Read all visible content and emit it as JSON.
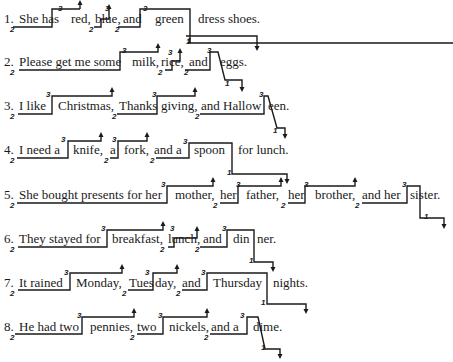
{
  "exercise": {
    "sentences": [
      {
        "number": "1.",
        "text": "She has red, blue, and green dress shoes.",
        "segments": [
          "She has",
          "red,",
          "blue,",
          "and",
          "green",
          "dress shoes."
        ]
      },
      {
        "number": "2.",
        "text": "Please get me some milk, rice, and eggs.",
        "segments": [
          "Please get me some",
          "milk,",
          "rice,",
          "and",
          "eggs."
        ]
      },
      {
        "number": "3.",
        "text": "I like Christmas, Thanksgiving, and Halloween.",
        "segments": [
          "I like",
          "Christmas,",
          "Thanks",
          "giving,",
          "and Hallow",
          "een."
        ]
      },
      {
        "number": "4.",
        "text": "I need a knife, a fork, and a spoon for lunch.",
        "segments": [
          "I need a",
          "knife,",
          "a",
          "fork,",
          "and a",
          "spoon",
          "for lunch."
        ]
      },
      {
        "number": "5.",
        "text": "She bought presents for her mother, her father, her brother, and her sister.",
        "segments": [
          "She bought presents for her",
          "mother,",
          "her",
          "father,",
          "her",
          "brother,",
          "and her",
          "sis",
          "ter."
        ]
      },
      {
        "number": "6.",
        "text": "They stayed for breakfast, lunch, and dinner.",
        "segments": [
          "They stayed for",
          "breakfast,",
          "lunch,",
          "and",
          "din",
          "ner."
        ]
      },
      {
        "number": "7.",
        "text": "It rained Monday, Tuesday, and Thursday nights.",
        "segments": [
          "It rained",
          "Monday,",
          "Tues",
          "day,",
          "and",
          "Thursday",
          "nights."
        ]
      },
      {
        "number": "8.",
        "text": "He had two pennies, two nickels, and a dime.",
        "segments": [
          "He had two",
          "pennies,",
          "two",
          "nickels,",
          "and a",
          "dime."
        ]
      }
    ],
    "pitch_levels": {
      "low": "2",
      "high": "3",
      "final": "1"
    }
  }
}
